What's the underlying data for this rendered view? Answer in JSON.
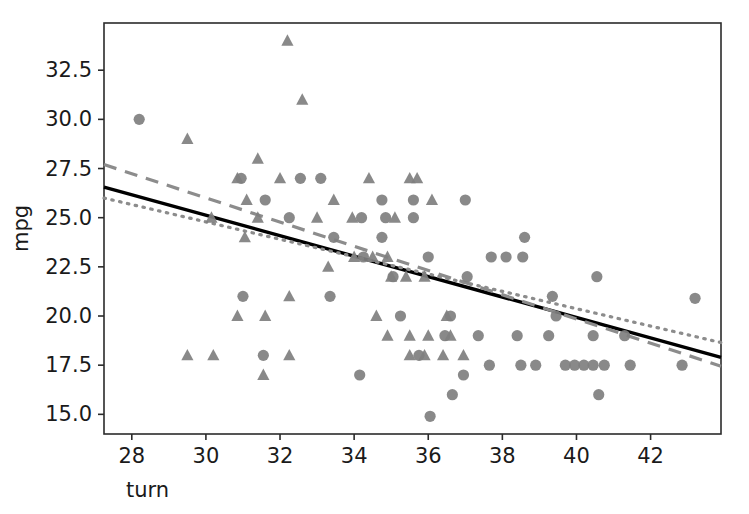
{
  "chart_data": {
    "type": "scatter",
    "title": "",
    "xlabel": "turn",
    "ylabel": "mpg",
    "xlim": [
      27.25,
      43.9
    ],
    "ylim": [
      14.0,
      34.9
    ],
    "xticks": [
      28,
      30,
      32,
      34,
      36,
      38,
      40,
      42
    ],
    "xtick_labels": [
      "28",
      "30",
      "32",
      "34",
      "36",
      "38",
      "40",
      "42"
    ],
    "yticks": [
      15.0,
      17.5,
      20.0,
      22.5,
      25.0,
      27.5,
      30.0,
      32.5
    ],
    "ytick_labels": [
      "15.0",
      "17.5",
      "20.0",
      "22.5",
      "25.0",
      "27.5",
      "30.0",
      "32.5"
    ],
    "grid": false,
    "legend": "none",
    "marker_color": "#7f7f7f",
    "series": [
      {
        "name": "circles",
        "marker": "circle",
        "color": "#7f7f7f",
        "points": [
          [
            28.2,
            30.0
          ],
          [
            30.95,
            27.0
          ],
          [
            32.55,
            27.0
          ],
          [
            33.1,
            27.0
          ],
          [
            31.6,
            25.9
          ],
          [
            34.75,
            25.9
          ],
          [
            35.6,
            25.9
          ],
          [
            37.0,
            25.9
          ],
          [
            32.25,
            25.0
          ],
          [
            34.2,
            25.0
          ],
          [
            34.85,
            25.0
          ],
          [
            35.6,
            25.0
          ],
          [
            33.45,
            24.0
          ],
          [
            34.75,
            24.0
          ],
          [
            38.6,
            24.0
          ],
          [
            34.25,
            23.0
          ],
          [
            36.0,
            23.0
          ],
          [
            37.7,
            23.0
          ],
          [
            38.1,
            23.0
          ],
          [
            38.55,
            23.0
          ],
          [
            33.35,
            21.0
          ],
          [
            35.05,
            22.0
          ],
          [
            37.05,
            22.0
          ],
          [
            40.55,
            22.0
          ],
          [
            31.0,
            21.0
          ],
          [
            39.35,
            21.0
          ],
          [
            43.2,
            20.9
          ],
          [
            35.25,
            20.0
          ],
          [
            39.45,
            20.0
          ],
          [
            36.6,
            20.0
          ],
          [
            37.35,
            19.0
          ],
          [
            38.4,
            19.0
          ],
          [
            39.25,
            19.0
          ],
          [
            40.45,
            19.0
          ],
          [
            41.3,
            19.0
          ],
          [
            31.55,
            18.0
          ],
          [
            35.75,
            18.0
          ],
          [
            36.45,
            19.0
          ],
          [
            34.15,
            17.0
          ],
          [
            36.95,
            17.0
          ],
          [
            37.65,
            17.5
          ],
          [
            38.5,
            17.5
          ],
          [
            38.9,
            17.5
          ],
          [
            39.7,
            17.5
          ],
          [
            39.95,
            17.5
          ],
          [
            40.2,
            17.5
          ],
          [
            40.45,
            17.5
          ],
          [
            40.75,
            17.5
          ],
          [
            41.45,
            17.5
          ],
          [
            42.85,
            17.5
          ],
          [
            36.65,
            16.0
          ],
          [
            40.6,
            16.0
          ],
          [
            36.05,
            14.9
          ]
        ]
      },
      {
        "name": "triangles",
        "marker": "triangle",
        "color": "#7f7f7f",
        "points": [
          [
            29.5,
            29.0
          ],
          [
            32.2,
            34.0
          ],
          [
            32.6,
            31.0
          ],
          [
            31.4,
            28.0
          ],
          [
            30.85,
            27.0
          ],
          [
            32.0,
            27.0
          ],
          [
            34.4,
            27.0
          ],
          [
            35.5,
            27.0
          ],
          [
            35.7,
            27.0
          ],
          [
            31.1,
            25.9
          ],
          [
            33.45,
            25.9
          ],
          [
            36.1,
            25.9
          ],
          [
            30.15,
            25.0
          ],
          [
            31.4,
            25.0
          ],
          [
            33.0,
            25.0
          ],
          [
            33.95,
            25.0
          ],
          [
            35.1,
            25.0
          ],
          [
            31.05,
            24.0
          ],
          [
            34.0,
            23.0
          ],
          [
            34.5,
            23.0
          ],
          [
            34.9,
            23.0
          ],
          [
            33.3,
            22.5
          ],
          [
            35.0,
            22.0
          ],
          [
            35.4,
            22.0
          ],
          [
            35.9,
            22.0
          ],
          [
            32.25,
            21.0
          ],
          [
            34.6,
            20.0
          ],
          [
            30.85,
            20.0
          ],
          [
            31.6,
            20.0
          ],
          [
            29.5,
            18.0
          ],
          [
            30.2,
            18.0
          ],
          [
            31.55,
            17.0
          ],
          [
            32.25,
            18.0
          ],
          [
            34.9,
            19.0
          ],
          [
            35.5,
            18.0
          ],
          [
            35.9,
            18.0
          ],
          [
            36.4,
            18.0
          ],
          [
            35.5,
            19.0
          ],
          [
            36.0,
            19.0
          ],
          [
            36.6,
            19.0
          ],
          [
            36.5,
            20.0
          ],
          [
            36.95,
            18.0
          ]
        ]
      }
    ],
    "lines": [
      {
        "name": "solid-fit",
        "style": "solid",
        "color": "#000000",
        "x0": 27.25,
        "y0": 26.55,
        "x1": 43.9,
        "y1": 17.9
      },
      {
        "name": "dashed-fit",
        "style": "dashed",
        "color": "#8c8c8c",
        "x0": 27.25,
        "y0": 27.7,
        "x1": 43.9,
        "y1": 17.45
      },
      {
        "name": "dotted-fit",
        "style": "dotted",
        "color": "#8c8c8c",
        "x0": 27.25,
        "y0": 26.0,
        "x1": 43.9,
        "y1": 18.65
      }
    ]
  }
}
